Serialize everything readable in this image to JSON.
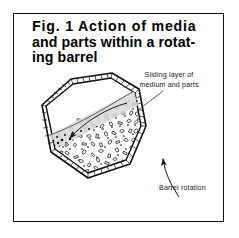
{
  "figure": {
    "title_lines": [
      "Fig. 1 Action of media",
      "and parts within a rotat-",
      "ing barrel"
    ],
    "title_full": "Fig. 1 Action of media and parts within a rotating barrel",
    "frame_color": "#111111",
    "background_color": "#ffffff",
    "ink_color": "#000000"
  },
  "annotations": {
    "sliding_layer": {
      "line1": "Sliding layer of",
      "line2": "medium and parts",
      "text_full": "Sliding layer of medium and parts"
    },
    "barrel_rotation": {
      "label": "Barrel rotation"
    }
  },
  "diagram": {
    "barrel_shape": "octagonal-barrel-cross-section",
    "wall_style": "double-line",
    "fill_material": "media-and-parts",
    "flow_arrow_label": "media flow direction",
    "rotation_arrow_label": "barrel rotation direction",
    "particle_count": 236,
    "band_dot_count": 150
  }
}
